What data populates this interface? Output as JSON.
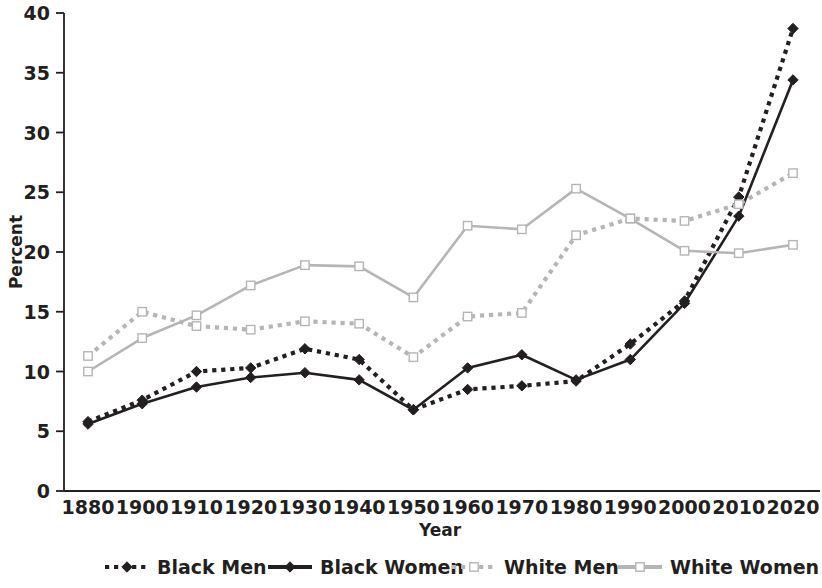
{
  "chart_data": {
    "type": "line",
    "title": "",
    "xlabel": "Year",
    "ylabel": "Percent",
    "categories": [
      "1880",
      "1900",
      "1910",
      "1920",
      "1930",
      "1940",
      "1950",
      "1960",
      "1970",
      "1980",
      "1990",
      "2000",
      "2010",
      "2020"
    ],
    "ylim": [
      0,
      40
    ],
    "yticks": [
      0,
      5,
      10,
      15,
      20,
      25,
      30,
      35,
      40
    ],
    "ytick_labels": [
      "0",
      "5",
      "10",
      "15",
      "20",
      "25",
      "30",
      "35",
      "40"
    ],
    "grid": false,
    "legend_position": "bottom",
    "series": [
      {
        "name": "Black Men",
        "color": "#231f20",
        "line_style": "dotted",
        "marker": "filled-diamond",
        "values": [
          5.8,
          7.6,
          10.0,
          10.3,
          11.9,
          11.0,
          6.8,
          8.5,
          8.8,
          9.2,
          12.3,
          15.9,
          24.6,
          38.7
        ]
      },
      {
        "name": "Black Women",
        "color": "#231f20",
        "line_style": "solid",
        "marker": "filled-diamond",
        "values": [
          5.6,
          7.3,
          8.7,
          9.5,
          9.9,
          9.3,
          6.8,
          10.3,
          11.4,
          9.3,
          11.0,
          15.7,
          23.0,
          34.4
        ]
      },
      {
        "name": "White Men",
        "color": "#b5b5b5",
        "line_style": "dotted",
        "marker": "open-square",
        "values": [
          11.3,
          15.0,
          13.8,
          13.5,
          14.2,
          14.0,
          11.2,
          14.6,
          14.9,
          21.4,
          22.8,
          22.6,
          24.0,
          26.6
        ]
      },
      {
        "name": "White Women",
        "color": "#b5b5b5",
        "line_style": "solid",
        "marker": "open-square",
        "values": [
          10.0,
          12.8,
          14.7,
          17.2,
          18.9,
          18.8,
          16.2,
          22.2,
          21.9,
          25.3,
          22.8,
          20.1,
          19.9,
          20.6
        ]
      }
    ]
  },
  "legend": {
    "items": [
      {
        "label": "Black Men"
      },
      {
        "label": "Black Women"
      },
      {
        "label": "White Men"
      },
      {
        "label": "White Women"
      }
    ]
  },
  "axes": {
    "y_title": "Percent",
    "x_title": "Year"
  }
}
